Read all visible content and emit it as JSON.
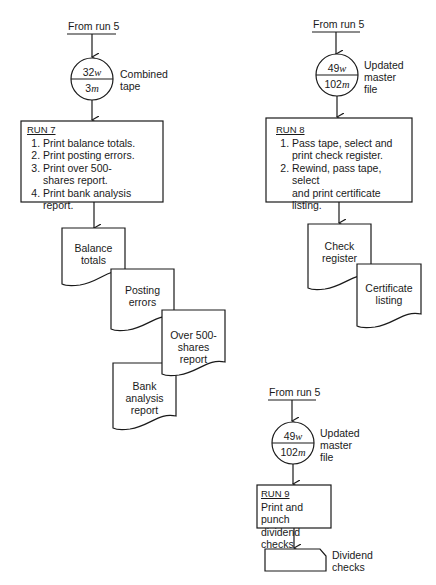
{
  "flow_left": {
    "source_label": "From run 5",
    "tape": {
      "top_value": "32",
      "top_unit": "w",
      "bottom_value": "3",
      "bottom_unit": "m",
      "label": [
        "Combined",
        "tape"
      ]
    },
    "run": {
      "title": "RUN 7",
      "steps": [
        "Print balance totals.",
        "Print posting errors.",
        "Print over 500-\nshares report.",
        "Print bank analysis report."
      ]
    },
    "documents": [
      {
        "lines": [
          "Balance",
          "totals"
        ]
      },
      {
        "lines": [
          "Posting",
          "errors"
        ]
      },
      {
        "lines": [
          "Over 500-",
          "shares",
          "report"
        ]
      },
      {
        "lines": [
          "Bank",
          "analysis",
          "report"
        ]
      }
    ]
  },
  "flow_right": {
    "source_label": "From run 5",
    "tape": {
      "top_value": "49",
      "top_unit": "w",
      "bottom_value": "102",
      "bottom_unit": "m",
      "label": [
        "Updated",
        "master",
        "file"
      ]
    },
    "run": {
      "title": "RUN 8",
      "steps": [
        "Pass tape, select and\nprint check register.",
        "Rewind, pass tape, select\nand print certificate\nlisting."
      ]
    },
    "documents": [
      {
        "lines": [
          "Check",
          "register"
        ]
      },
      {
        "lines": [
          "Certificate",
          "listing"
        ]
      }
    ]
  },
  "flow_bottom": {
    "source_label": "From run 5",
    "tape": {
      "top_value": "49",
      "top_unit": "w",
      "bottom_value": "102",
      "bottom_unit": "m",
      "label": [
        "Updated",
        "master",
        "file"
      ]
    },
    "run": {
      "title": "RUN 9",
      "lines": [
        "Print and punch",
        "dividend checks"
      ]
    },
    "card": {
      "lines": [
        "Dividend",
        "checks"
      ]
    }
  }
}
